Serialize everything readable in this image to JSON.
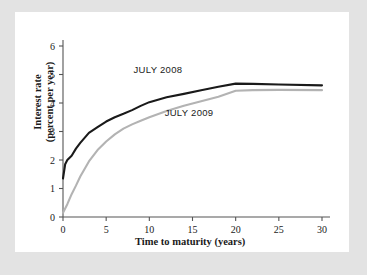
{
  "figure": {
    "background_color": "#e3e3e3",
    "panel_color": "#ffffff"
  },
  "chart_data": {
    "type": "line",
    "title": "",
    "xlabel": "Time to maturity (years)",
    "ylabel": "Interest rate\n(percent per year)",
    "ylabel_line1": "Interest rate",
    "ylabel_line2": "(percent per year)",
    "xlim": [
      0,
      30
    ],
    "ylim": [
      0,
      6
    ],
    "xticks": [
      0,
      5,
      10,
      15,
      20,
      25,
      30
    ],
    "xtick_labels": [
      "0",
      "5",
      "10",
      "15",
      "20",
      "25",
      "30"
    ],
    "yticks": [
      0,
      1,
      2,
      3,
      4,
      5,
      6
    ],
    "ytick_labels": [
      "0",
      "1",
      "2",
      "3",
      "4",
      "5",
      "6"
    ],
    "grid": false,
    "legend_position": "inline-annotation",
    "series": [
      {
        "name": "JULY 2008",
        "color": "#1a1a1a",
        "line_width": 2.1,
        "annotation": "JULY 2008",
        "annotation_x": 11.0,
        "annotation_y": 5.05,
        "x": [
          0,
          0.25,
          0.5,
          1,
          1.5,
          2,
          3,
          4,
          5,
          6,
          7,
          8,
          9,
          10,
          12,
          14,
          16,
          18,
          20,
          22,
          25,
          30
        ],
        "y": [
          1.35,
          1.85,
          2.0,
          2.15,
          2.4,
          2.6,
          2.95,
          3.15,
          3.35,
          3.5,
          3.62,
          3.75,
          3.9,
          4.03,
          4.2,
          4.32,
          4.45,
          4.57,
          4.68,
          4.67,
          4.65,
          4.62
        ]
      },
      {
        "name": "JULY 2009",
        "color": "#b3b3b3",
        "line_width": 2.1,
        "annotation": "JULY 2009",
        "annotation_x": 14.6,
        "annotation_y": 3.56,
        "x": [
          0,
          0.5,
          1,
          1.5,
          2,
          3,
          4,
          5,
          6,
          7,
          8,
          9,
          10,
          12,
          14,
          16,
          18,
          20,
          22,
          25,
          30
        ],
        "y": [
          0.15,
          0.45,
          0.8,
          1.1,
          1.42,
          1.95,
          2.35,
          2.65,
          2.9,
          3.1,
          3.25,
          3.38,
          3.5,
          3.72,
          3.9,
          4.06,
          4.22,
          4.43,
          4.45,
          4.46,
          4.45
        ]
      }
    ]
  }
}
